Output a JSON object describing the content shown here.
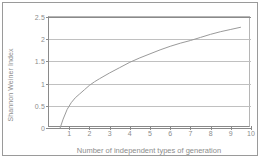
{
  "chart_data": {
    "type": "line",
    "title": "",
    "xlabel": "Number of independent types of generation",
    "ylabel": "Shannon Weiner Index",
    "xlim": [
      0,
      10
    ],
    "ylim": [
      0,
      2.5
    ],
    "xticks": [
      "1",
      "2",
      "3",
      "4",
      "5",
      "6",
      "7",
      "8",
      "9",
      "10"
    ],
    "xtick_values": [
      1,
      2,
      3,
      4,
      5,
      6,
      7,
      8,
      9,
      10
    ],
    "yticks": [
      "0",
      "0.5",
      "1",
      "1.5",
      "2",
      "2.5"
    ],
    "ytick_values": [
      0,
      0.5,
      1,
      1.5,
      2,
      2.5
    ],
    "grid": "horizontal",
    "legend": "none",
    "series": [
      {
        "name": "Shannon Weiner Index",
        "x": [
          0.55,
          0.7,
          0.9,
          1.1,
          1.3,
          1.5,
          1.75,
          2.0,
          2.25,
          2.5,
          3.0,
          3.5,
          4.0,
          4.5,
          5.0,
          5.5,
          6.0,
          6.5,
          7.0,
          7.5,
          8.0,
          8.5,
          9.0,
          9.5
        ],
        "values": [
          0.0,
          0.2,
          0.42,
          0.57,
          0.68,
          0.76,
          0.86,
          0.96,
          1.04,
          1.11,
          1.24,
          1.36,
          1.48,
          1.58,
          1.67,
          1.76,
          1.84,
          1.91,
          1.97,
          2.04,
          2.11,
          2.17,
          2.22,
          2.27
        ]
      }
    ]
  },
  "axes": {
    "y_title": "Shannon Weiner Index",
    "x_title": "Number of independent types of generation"
  }
}
